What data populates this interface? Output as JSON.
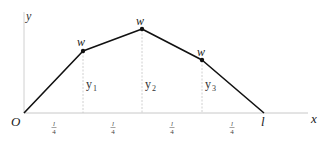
{
  "diagram": {
    "type": "loaded-string-deflection",
    "colors": {
      "axis": "#c8c8c8",
      "string": "#111111",
      "dashed": "#bdbdbd",
      "text": "#222222",
      "point": "#111111"
    },
    "axes": {
      "origin_label": "O",
      "x_label": "x",
      "y_label": "y",
      "end_label": "l"
    },
    "points": [
      {
        "load_label": "w",
        "height_label": "y",
        "height_sub": "1"
      },
      {
        "load_label": "w",
        "height_label": "y",
        "height_sub": "2"
      },
      {
        "load_label": "w",
        "height_label": "y",
        "height_sub": "3"
      }
    ],
    "segments": [
      {
        "num": "l",
        "den": "4"
      },
      {
        "num": "l",
        "den": "4"
      },
      {
        "num": "l",
        "den": "4"
      },
      {
        "num": "l",
        "den": "4"
      }
    ]
  }
}
